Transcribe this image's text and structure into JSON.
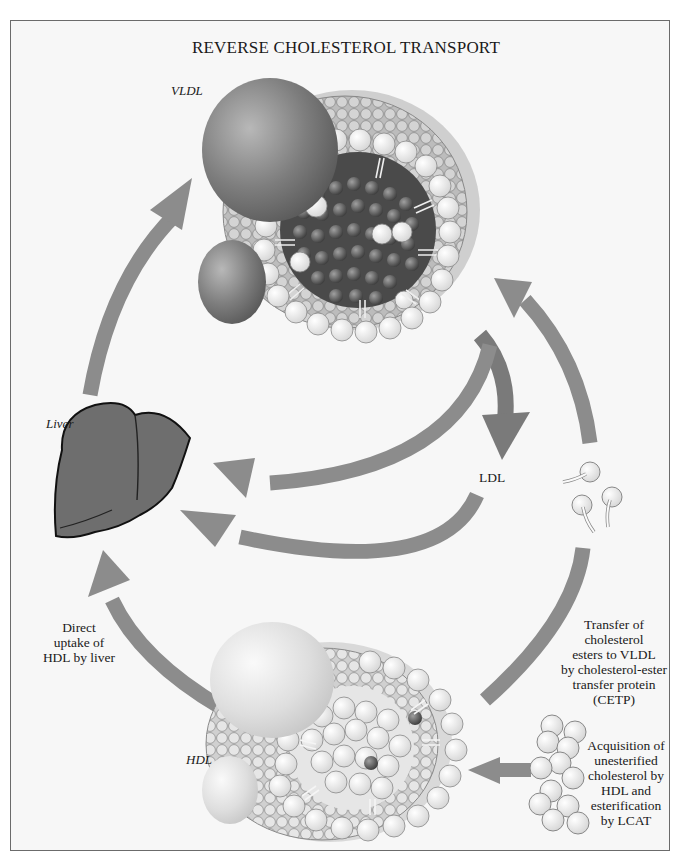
{
  "diagram": {
    "title": "REVERSE CHOLESTEROL TRANSPORT",
    "labels": {
      "vldl": "VLDL",
      "liver": "Liver",
      "ldl": "LDL",
      "hdl": "HDL"
    },
    "captions": {
      "direct_uptake": [
        "Direct",
        "uptake of",
        "HDL by liver"
      ],
      "cetp_transfer": [
        "Transfer of",
        "cholesterol",
        "esters to VLDL",
        "by cholesterol-ester",
        "transfer protein",
        "(CETP)"
      ],
      "lcat_acquisition": [
        "Acquisition of",
        "unesterified",
        "cholesterol by",
        "HDL and",
        "esterification",
        "by LCAT"
      ]
    },
    "nodes": [
      {
        "id": "vldl",
        "name": "VLDL particle",
        "position": "top-center"
      },
      {
        "id": "liver",
        "name": "Liver",
        "position": "left"
      },
      {
        "id": "ldl",
        "name": "LDL",
        "position": "center-right"
      },
      {
        "id": "hdl",
        "name": "HDL particle",
        "position": "bottom-center"
      },
      {
        "id": "cholesterol-esters",
        "name": "Cholesterol esters",
        "position": "right"
      },
      {
        "id": "unesterified-cholesterol",
        "name": "Unesterified cholesterol",
        "position": "bottom-right"
      }
    ],
    "edges": [
      {
        "from": "liver",
        "to": "vldl",
        "label": ""
      },
      {
        "from": "vldl",
        "to": "ldl",
        "label": ""
      },
      {
        "from": "vldl",
        "to": "liver",
        "label": ""
      },
      {
        "from": "ldl",
        "to": "liver",
        "label": ""
      },
      {
        "from": "hdl",
        "to": "liver",
        "label": "Direct uptake of HDL by liver"
      },
      {
        "from": "hdl",
        "to": "vldl",
        "label": "Transfer of cholesterol esters to VLDL by cholesterol-ester transfer protein (CETP)"
      },
      {
        "from": "unesterified-cholesterol",
        "to": "hdl",
        "label": "Acquisition of unesterified cholesterol by HDL and esterification by LCAT"
      }
    ],
    "colors": {
      "background": "#f7f7f7",
      "frame": "#6b6b6b",
      "arrow": "#8c8c8c",
      "arrow_dark": "#7a7a7a",
      "liver": "#6e6e6e",
      "vldl_core": "#4a4a4a",
      "vldl_apoprotein": "#7d7d7d",
      "hdl_apoprotein": "#d8d8d8",
      "phospholipid_head": "#ececec",
      "phospholipid_head_shaded": "#bdbdbd"
    }
  }
}
